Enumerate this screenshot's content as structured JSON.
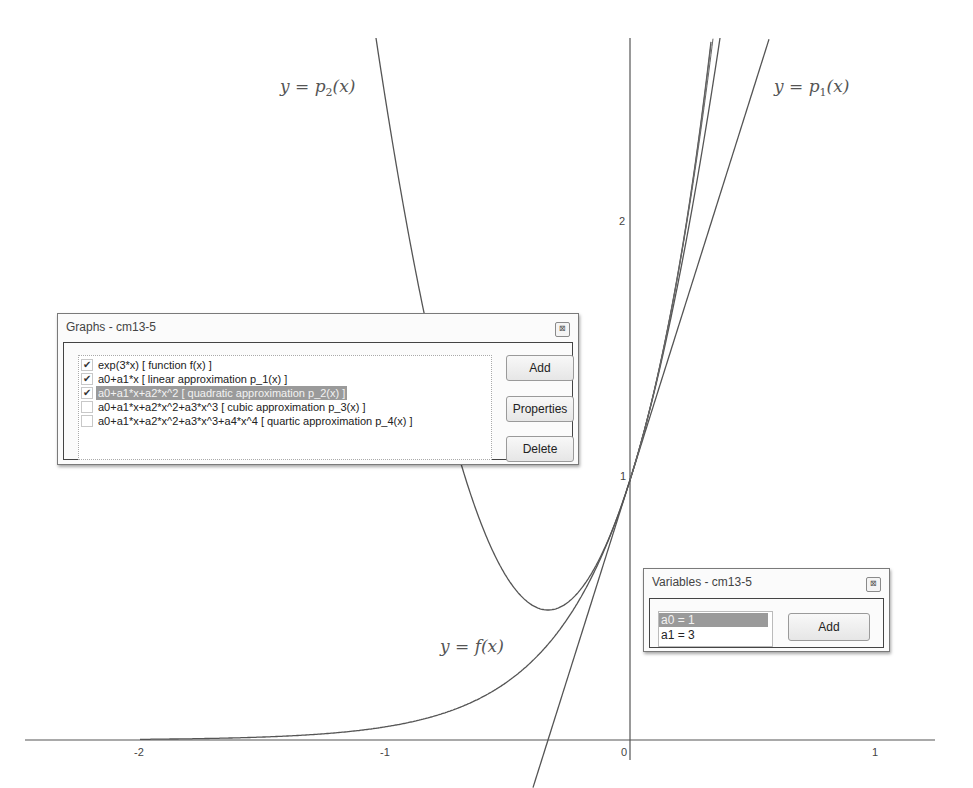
{
  "chart_data": {
    "type": "line",
    "title": "",
    "xlabel": "",
    "ylabel": "",
    "xlim": [
      -2.5,
      1.2
    ],
    "ylim": [
      -0.2,
      2.8
    ],
    "grid": false,
    "x_ticks": [
      -2,
      -1,
      0,
      1
    ],
    "y_ticks": [
      1,
      2
    ],
    "series": [
      {
        "name": "y = f(x)",
        "expression": "exp(3*x)",
        "color": "#555555"
      },
      {
        "name": "y = p1(x)",
        "expression": "1+3*x",
        "color": "#555555"
      },
      {
        "name": "y = p2(x)",
        "expression": "1+3*x+4.5*x^2",
        "color": "#555555"
      }
    ],
    "annotations": [
      {
        "text": "y = p2(x)",
        "x": -1.4,
        "y": 2.55
      },
      {
        "text": "y = p1(x)",
        "x": 0.6,
        "y": 2.55
      },
      {
        "text": "y = f(x)",
        "x": -0.78,
        "y": 0.37
      }
    ]
  },
  "axes": {
    "x_tick_labels": [
      "-2",
      "-1",
      "0",
      "1"
    ],
    "y_tick_labels": [
      "1",
      "2"
    ]
  },
  "curve_labels": {
    "p2": {
      "lhs": "y = p",
      "sub": "2",
      "rhs": "(x)"
    },
    "p1": {
      "lhs": "y = p",
      "sub": "1",
      "rhs": "(x)"
    },
    "f": {
      "text": "y = f(x)"
    }
  },
  "graphs_dialog": {
    "title": "Graphs - cm13-5",
    "close_glyph": "⊠",
    "items": [
      {
        "checked": true,
        "selected": false,
        "label": "exp(3*x) [   function  f(x)   ]"
      },
      {
        "checked": true,
        "selected": false,
        "label": "a0+a1*x [  linear approximation  p_1(x)   ]"
      },
      {
        "checked": true,
        "selected": true,
        "label": "a0+a1*x+a2*x^2 [    quadratic approximation  p_2(x)   ]"
      },
      {
        "checked": false,
        "selected": false,
        "label": "a0+a1*x+a2*x^2+a3*x^3 [    cubic approximation  p_3(x)   ]"
      },
      {
        "checked": false,
        "selected": false,
        "label": "a0+a1*x+a2*x^2+a3*x^3+a4*x^4 [    quartic approximation   p_4(x)   ]"
      }
    ],
    "buttons": {
      "add": "Add",
      "properties": "Properties",
      "delete": "Delete"
    }
  },
  "variables_dialog": {
    "title": "Variables - cm13-5",
    "close_glyph": "⊠",
    "items": [
      {
        "label": "a0 = 1",
        "selected": true
      },
      {
        "label": "a1 = 3",
        "selected": false
      }
    ],
    "buttons": {
      "add": "Add"
    }
  }
}
